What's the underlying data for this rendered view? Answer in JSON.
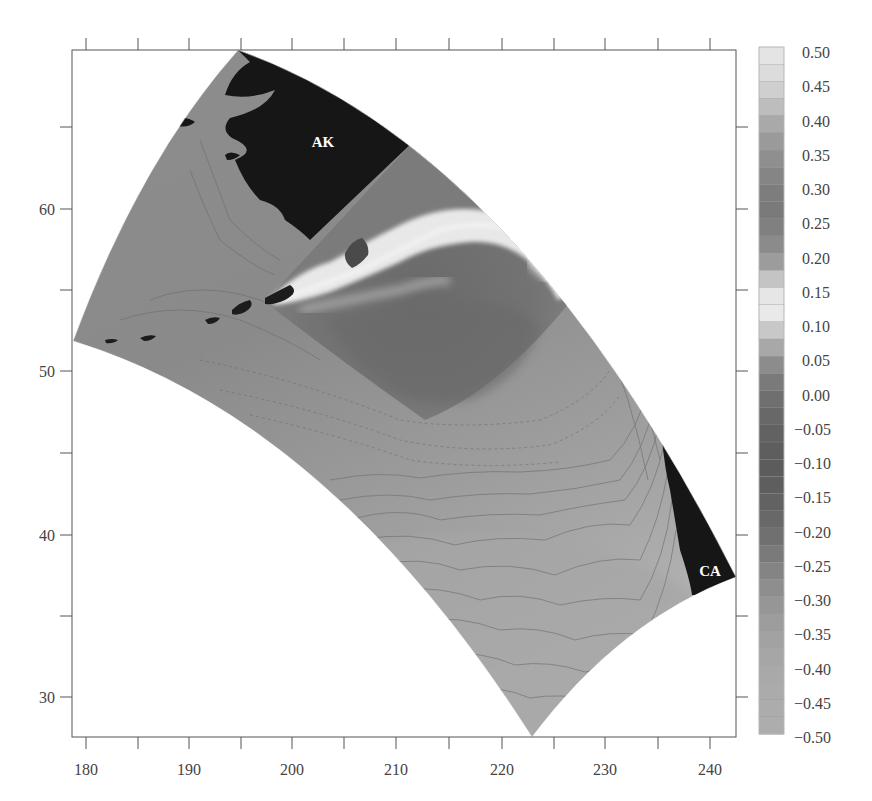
{
  "chart_data": {
    "type": "heatmap",
    "title": "",
    "xlabel": "",
    "ylabel": "",
    "xlim": [
      179,
      242
    ],
    "ylim": [
      27.5,
      70
    ],
    "x_ticks": [
      180,
      190,
      200,
      210,
      220,
      230,
      240
    ],
    "x_tick_labels": [
      "180",
      "190",
      "200",
      "210",
      "220",
      "230",
      "240"
    ],
    "x_minor_ticks": [
      185,
      195,
      205,
      215,
      225,
      235
    ],
    "y_ticks": [
      30,
      40,
      50,
      60
    ],
    "y_tick_labels": [
      "30",
      "40",
      "50",
      "60"
    ],
    "y_minor_ticks": [
      35,
      45,
      55,
      65
    ],
    "grid": false,
    "domain_description": "Curved (Lambert-conic) North Pacific model domain shaded grayscale with contour lines; nested higher-resolution Gulf of Alaska subdomain showing light band along coast; land masked black",
    "annotations": [
      {
        "text": "AK",
        "x": 203,
        "y": 63.5,
        "color": "#ffffff"
      },
      {
        "text": "CA",
        "x": 239.5,
        "y": 38.5,
        "color": "#ffffff"
      }
    ],
    "colorbar": {
      "position": "right",
      "min": -0.5,
      "max": 0.5,
      "step": 0.05,
      "tick_labels": [
        "0.50",
        "0.45",
        "0.40",
        "0.35",
        "0.30",
        "0.25",
        "0.20",
        "0.15",
        "0.10",
        "0.05",
        "0.00",
        "−0.05",
        "−0.10",
        "−0.15",
        "−0.20",
        "−0.25",
        "−0.30",
        "−0.35",
        "−0.40",
        "−0.45",
        "−0.50"
      ],
      "colors": [
        "#e4e4e4",
        "#dcdcdc",
        "#cfcfcf",
        "#bdbdbd",
        "#a9a9a9",
        "#9a9a9a",
        "#8f8f8f",
        "#858585",
        "#7d7d7d",
        "#7a7a7a",
        "#808080",
        "#8b8b8b",
        "#9c9c9c",
        "#c4c4c4",
        "#e6e6e6",
        "#e9e9e9",
        "#c8c8c8",
        "#a8a8a8",
        "#8c8c8c",
        "#7a7a7a",
        "#6f6f6f",
        "#686868",
        "#626262",
        "#5e5e5e",
        "#5c5c5c",
        "#5e5e5e",
        "#626262",
        "#686868",
        "#707070",
        "#7a7a7a",
        "#848484",
        "#8e8e8e",
        "#969696",
        "#9d9d9d",
        "#a2a2a2",
        "#a6a6a6",
        "#a9a9a9",
        "#ababab",
        "#acacac",
        "#adadad"
      ]
    }
  },
  "labels": {
    "ak": "AK",
    "ca": "CA"
  },
  "axes": {
    "x_labels": [
      "180",
      "190",
      "200",
      "210",
      "220",
      "230",
      "240"
    ],
    "y_labels": [
      "30",
      "40",
      "50",
      "60"
    ]
  },
  "colorbar_labels": [
    "0.50",
    "0.45",
    "0.40",
    "0.35",
    "0.30",
    "0.25",
    "0.20",
    "0.15",
    "0.10",
    "0.05",
    "0.00",
    "−0.05",
    "−0.10",
    "−0.15",
    "−0.20",
    "−0.25",
    "−0.30",
    "−0.35",
    "−0.40",
    "−0.45",
    "−0.50"
  ]
}
